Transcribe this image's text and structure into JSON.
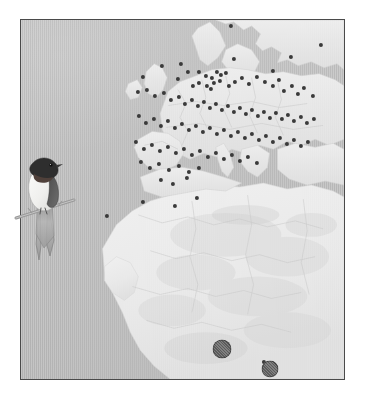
{
  "figure": {
    "type": "distribution-map",
    "region": "Europe, North Africa and the Sahel",
    "projection_bounds": {
      "left": 20,
      "top": 19,
      "width": 325,
      "height": 361
    },
    "background_color": "#ffffff",
    "ocean_color": "#b6b6b6",
    "land_color": "#e6e6e6",
    "border_color": "#4a4a4a",
    "marker_color": "#3a3a3a",
    "large_marker_color": "#5c5c5c"
  },
  "illustration": {
    "species": "barn-swallow",
    "name": "Barn Swallow",
    "pose": "perched on branch",
    "plumage": {
      "crown_color": "#2b2b2b",
      "throat_color": "#4a3a34",
      "underpart_color": "#f2f2f0",
      "upperpart_color": "#3d3d3d",
      "branch_color": "#8d8d8d"
    }
  },
  "map": {
    "land_regions": [
      "Scandinavia",
      "British Isles",
      "Iberian Peninsula",
      "France",
      "Central Europe",
      "Italy",
      "Balkans",
      "Eastern Europe",
      "Anatolia",
      "North Africa",
      "Sahara",
      "Sahel",
      "West Africa"
    ]
  },
  "chart_data": {
    "type": "scatter",
    "title": "",
    "xlabel": "",
    "ylabel": "",
    "xlim": [
      0,
      325
    ],
    "ylim": [
      0,
      361
    ],
    "grid": false,
    "legend": null,
    "annotations": [],
    "series": [
      {
        "name": "recovery-locations",
        "marker": "circle",
        "color": "#3a3a3a",
        "radius": 2.1,
        "count": 118,
        "points": [
          [
            210,
            6
          ],
          [
            300,
            25
          ],
          [
            213,
            39
          ],
          [
            252,
            51
          ],
          [
            270,
            37
          ],
          [
            141,
            46
          ],
          [
            160,
            44
          ],
          [
            167,
            52
          ],
          [
            122,
            57
          ],
          [
            157,
            59
          ],
          [
            178,
            52
          ],
          [
            185,
            56
          ],
          [
            191,
            58
          ],
          [
            196,
            52
          ],
          [
            200,
            55
          ],
          [
            205,
            53
          ],
          [
            193,
            63
          ],
          [
            199,
            61
          ],
          [
            186,
            66
          ],
          [
            190,
            69
          ],
          [
            178,
            63
          ],
          [
            172,
            66
          ],
          [
            208,
            66
          ],
          [
            214,
            62
          ],
          [
            221,
            58
          ],
          [
            228,
            64
          ],
          [
            236,
            57
          ],
          [
            244,
            62
          ],
          [
            252,
            66
          ],
          [
            258,
            60
          ],
          [
            263,
            71
          ],
          [
            271,
            66
          ],
          [
            277,
            74
          ],
          [
            283,
            68
          ],
          [
            292,
            76
          ],
          [
            117,
            72
          ],
          [
            126,
            70
          ],
          [
            134,
            76
          ],
          [
            143,
            73
          ],
          [
            150,
            80
          ],
          [
            158,
            77
          ],
          [
            164,
            84
          ],
          [
            171,
            80
          ],
          [
            177,
            86
          ],
          [
            183,
            82
          ],
          [
            189,
            88
          ],
          [
            195,
            84
          ],
          [
            201,
            90
          ],
          [
            207,
            86
          ],
          [
            213,
            92
          ],
          [
            219,
            88
          ],
          [
            225,
            94
          ],
          [
            231,
            90
          ],
          [
            237,
            96
          ],
          [
            243,
            92
          ],
          [
            249,
            98
          ],
          [
            255,
            93
          ],
          [
            261,
            99
          ],
          [
            267,
            95
          ],
          [
            273,
            101
          ],
          [
            280,
            97
          ],
          [
            286,
            103
          ],
          [
            293,
            99
          ],
          [
            118,
            96
          ],
          [
            125,
            103
          ],
          [
            133,
            99
          ],
          [
            140,
            106
          ],
          [
            147,
            101
          ],
          [
            154,
            108
          ],
          [
            161,
            104
          ],
          [
            168,
            110
          ],
          [
            175,
            106
          ],
          [
            182,
            112
          ],
          [
            189,
            108
          ],
          [
            196,
            114
          ],
          [
            203,
            110
          ],
          [
            210,
            116
          ],
          [
            217,
            112
          ],
          [
            224,
            118
          ],
          [
            231,
            114
          ],
          [
            238,
            120
          ],
          [
            245,
            116
          ],
          [
            252,
            122
          ],
          [
            259,
            118
          ],
          [
            266,
            124
          ],
          [
            273,
            120
          ],
          [
            280,
            126
          ],
          [
            287,
            122
          ],
          [
            115,
            122
          ],
          [
            123,
            129
          ],
          [
            131,
            125
          ],
          [
            139,
            131
          ],
          [
            147,
            127
          ],
          [
            155,
            133
          ],
          [
            163,
            129
          ],
          [
            171,
            135
          ],
          [
            179,
            131
          ],
          [
            187,
            137
          ],
          [
            195,
            133
          ],
          [
            203,
            139
          ],
          [
            211,
            135
          ],
          [
            219,
            141
          ],
          [
            227,
            137
          ],
          [
            236,
            143
          ],
          [
            120,
            142
          ],
          [
            129,
            148
          ],
          [
            138,
            144
          ],
          [
            148,
            150
          ],
          [
            158,
            146
          ],
          [
            168,
            152
          ],
          [
            178,
            148
          ],
          [
            140,
            160
          ],
          [
            152,
            164
          ],
          [
            166,
            158
          ],
          [
            86,
            196
          ],
          [
            122,
            182
          ],
          [
            154,
            186
          ],
          [
            176,
            178
          ],
          [
            204,
            330
          ],
          [
            243,
            342
          ]
        ]
      },
      {
        "name": "wintering-concentrations",
        "marker": "large-circle",
        "color": "#5c5c5c",
        "count": 2,
        "points": [
          {
            "x": 201,
            "y": 329,
            "diameter": 19
          },
          {
            "x": 249,
            "y": 349,
            "diameter": 17
          }
        ]
      }
    ]
  }
}
